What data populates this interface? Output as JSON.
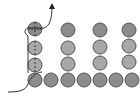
{
  "diagram": {
    "width": 140,
    "height": 102,
    "circle_radius": 7,
    "colors": {
      "circle_fill_dark": "#8c8c8c",
      "circle_fill_light": "#a8a8a8",
      "circle_stroke": "#555555",
      "path_stroke": "#333333",
      "background": "#ffffff"
    },
    "circles": [
      {
        "cx": 35,
        "cy": 29,
        "shade": "dark",
        "pierced": true
      },
      {
        "cx": 35,
        "cy": 48,
        "shade": "light",
        "pierced": true
      },
      {
        "cx": 35,
        "cy": 65,
        "shade": "light",
        "pierced": true
      },
      {
        "cx": 68,
        "cy": 30,
        "shade": "dark",
        "pierced": false
      },
      {
        "cx": 68,
        "cy": 48,
        "shade": "light",
        "pierced": false
      },
      {
        "cx": 68,
        "cy": 64,
        "shade": "light",
        "pierced": false
      },
      {
        "cx": 100,
        "cy": 30,
        "shade": "dark",
        "pierced": false
      },
      {
        "cx": 100,
        "cy": 47,
        "shade": "light",
        "pierced": false
      },
      {
        "cx": 100,
        "cy": 63,
        "shade": "light",
        "pierced": false
      },
      {
        "cx": 129,
        "cy": 30,
        "shade": "dark",
        "pierced": false
      },
      {
        "cx": 129,
        "cy": 46,
        "shade": "light",
        "pierced": false
      },
      {
        "cx": 129,
        "cy": 62,
        "shade": "light",
        "pierced": false
      },
      {
        "cx": 35,
        "cy": 80,
        "shade": "dark",
        "pierced": false
      },
      {
        "cx": 51,
        "cy": 80,
        "shade": "dark",
        "pierced": false
      },
      {
        "cx": 68,
        "cy": 80,
        "shade": "dark",
        "pierced": false
      },
      {
        "cx": 84,
        "cy": 80,
        "shade": "dark",
        "pierced": false
      },
      {
        "cx": 100,
        "cy": 80,
        "shade": "dark",
        "pierced": false
      },
      {
        "cx": 116,
        "cy": 80,
        "shade": "dark",
        "pierced": false
      },
      {
        "cx": 132,
        "cy": 80,
        "shade": "dark",
        "pierced": false
      }
    ],
    "path": {
      "description": "Curve entering from lower-left, looping around the first column and exiting upward as an arrow",
      "d": "M 8 92 C 20 92, 26 88, 28 82 C 30 76, 24 74, 28 72 L 28 35 C 24 30, 26 24, 34 25 C 42 26, 46 29, 44 28 C 52 24, 52 18, 52 6",
      "arrow_tip": {
        "x": 52,
        "y": 3
      }
    }
  }
}
